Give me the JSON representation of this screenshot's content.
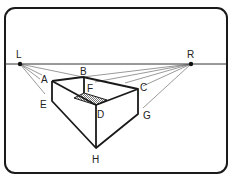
{
  "diagram": {
    "vanishing_points": [
      {
        "label": "L",
        "x": 20,
        "y": 64
      },
      {
        "label": "R",
        "x": 191,
        "y": 64
      }
    ],
    "point_labels": {
      "L": "L",
      "R": "R",
      "A": "A",
      "B": "B",
      "C": "C",
      "D": "D",
      "E": "E",
      "F": "F",
      "G": "G",
      "H": "H"
    },
    "colors": {
      "stroke": "#1a1a1a",
      "guide": "#555555",
      "hatch": "#888888",
      "background": "#ffffff"
    }
  }
}
